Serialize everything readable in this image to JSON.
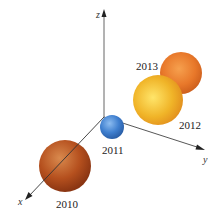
{
  "axes": {
    "x": {
      "label": "x"
    },
    "y": {
      "label": "y"
    },
    "z": {
      "label": "z"
    }
  },
  "spheres": [
    {
      "year": "2010",
      "color": "#b5501e",
      "highlight": "#d9864a"
    },
    {
      "year": "2011",
      "color": "#3f7fcf",
      "highlight": "#7fb0ea"
    },
    {
      "year": "2012",
      "color": "#f0b428",
      "highlight": "#ffe06a"
    },
    {
      "year": "2013",
      "color": "#e8782a",
      "highlight": "#f6a352"
    }
  ]
}
